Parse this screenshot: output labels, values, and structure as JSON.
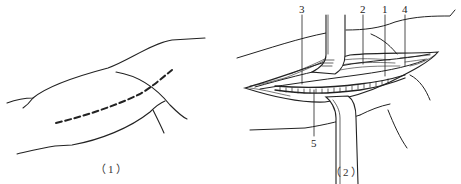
{
  "figure": {
    "panels": [
      {
        "id": "1",
        "caption": "（1）",
        "description": "Outline of upper arm with dashed incision line"
      },
      {
        "id": "2",
        "caption": "（2）",
        "description": "Opened incision with retractors exposing structures",
        "labels": [
          {
            "number": "1"
          },
          {
            "number": "2"
          },
          {
            "number": "3"
          },
          {
            "number": "4"
          },
          {
            "number": "5"
          }
        ]
      }
    ],
    "colors": {
      "line": "#222222",
      "background": "#ffffff"
    }
  }
}
